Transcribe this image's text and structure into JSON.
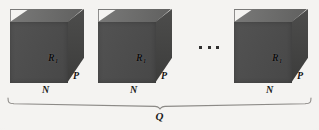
{
  "figure": {
    "type": "technical-diagram",
    "background_color": "#f4f3f1",
    "cube_front_color": "#4b4b4b",
    "cube_top_color": "#6a6a69",
    "cube_side_color": "#434342",
    "label_color": "#121212"
  },
  "cubes": [
    {
      "index": 1,
      "face_label": "R",
      "face_label_sub": "1",
      "depth_label": "P",
      "width_label": "N",
      "x": 10,
      "y": 9
    },
    {
      "index": 2,
      "face_label": "R",
      "face_label_sub": "1",
      "depth_label": "P",
      "width_label": "N",
      "x": 98,
      "y": 9
    },
    {
      "index": 3,
      "face_label": "R",
      "face_label_sub": "1",
      "depth_label": "P",
      "width_label": "N",
      "x": 234,
      "y": 9
    }
  ],
  "ellipsis": {
    "glyph": "...",
    "dot_count": 3
  },
  "brace": {
    "label": "Q",
    "orientation": "horizontal-下-brace",
    "spans_all_cubes": true
  }
}
